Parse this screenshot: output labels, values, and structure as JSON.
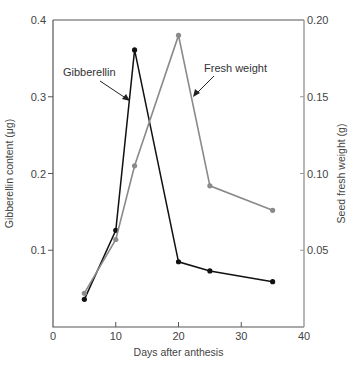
{
  "chart_data": {
    "type": "line",
    "title": "",
    "xlabel": "Days after anthesis",
    "ylabel": "Gibberellin content (μg)",
    "y2label": "Seed fresh weight (g)",
    "xlim": [
      0,
      40
    ],
    "ylim": [
      0,
      0.4
    ],
    "y2lim": [
      0,
      0.2
    ],
    "grid": false,
    "x_ticks": [
      "0",
      "10",
      "20",
      "30",
      "40"
    ],
    "y_ticks": [
      "0",
      "0.1",
      "0.2",
      "0.3",
      "0.4"
    ],
    "y2_ticks": [
      "0.05",
      "0.10",
      "0.15",
      "0.20"
    ],
    "series": [
      {
        "name": "Gibberellin",
        "axis": "left",
        "color": "#111111",
        "x": [
          5,
          10,
          13,
          20,
          25,
          35
        ],
        "values": [
          0.036,
          0.126,
          0.361,
          0.085,
          0.073,
          0.059
        ]
      },
      {
        "name": "Fresh weight",
        "axis": "right",
        "color": "#8a8a8a",
        "x": [
          5,
          10,
          13,
          20,
          25,
          35
        ],
        "values": [
          0.022,
          0.057,
          0.105,
          0.19,
          0.092,
          0.076
        ]
      }
    ],
    "annotations": [
      {
        "text": "Gibberellin",
        "points_to": "Gibberellin"
      },
      {
        "text": "Fresh weight",
        "points_to": "Fresh weight"
      }
    ]
  }
}
